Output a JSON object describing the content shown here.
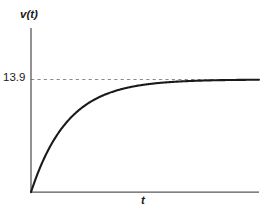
{
  "figure": {
    "background_color": "#ffffff",
    "axis_color": "#58585a",
    "curve_color": "#1a1a1a",
    "dash_color": "#8c8c8e",
    "text_color": "#1a1a1a"
  },
  "labels": {
    "y_axis_label": "v(t)",
    "x_axis_label": "t",
    "y_tick_label": "13.9"
  },
  "chart_data": {
    "type": "line",
    "title": "",
    "xlabel": "t",
    "ylabel": "v(t)",
    "grid": false,
    "legend": null,
    "xlim": [
      0,
      10
    ],
    "ylim": [
      0,
      16.2
    ],
    "xticks": [],
    "yticks": [
      13.9
    ],
    "ytick_labels": [
      "13.9"
    ],
    "annotations": [
      {
        "type": "horizontal-asymptote",
        "value": 13.9,
        "label": "13.9",
        "style": "dashed"
      }
    ],
    "series": [
      {
        "name": "v(t)",
        "equation": "v(t) = 13.9 (1 - e^(-0.62 t))",
        "x": [
          0,
          0.25,
          0.5,
          0.75,
          1,
          1.5,
          2,
          2.5,
          3,
          3.5,
          4,
          4.5,
          5,
          5.5,
          6,
          6.5,
          7,
          7.5,
          8,
          8.5,
          9,
          9.5,
          10
        ],
        "y": [
          0,
          1.99,
          3.69,
          5.15,
          6.4,
          8.41,
          9.88,
          10.95,
          11.73,
          12.3,
          12.72,
          13.03,
          13.25,
          13.41,
          13.53,
          13.62,
          13.69,
          13.74,
          13.77,
          13.8,
          13.82,
          13.84,
          13.85
        ]
      }
    ]
  }
}
